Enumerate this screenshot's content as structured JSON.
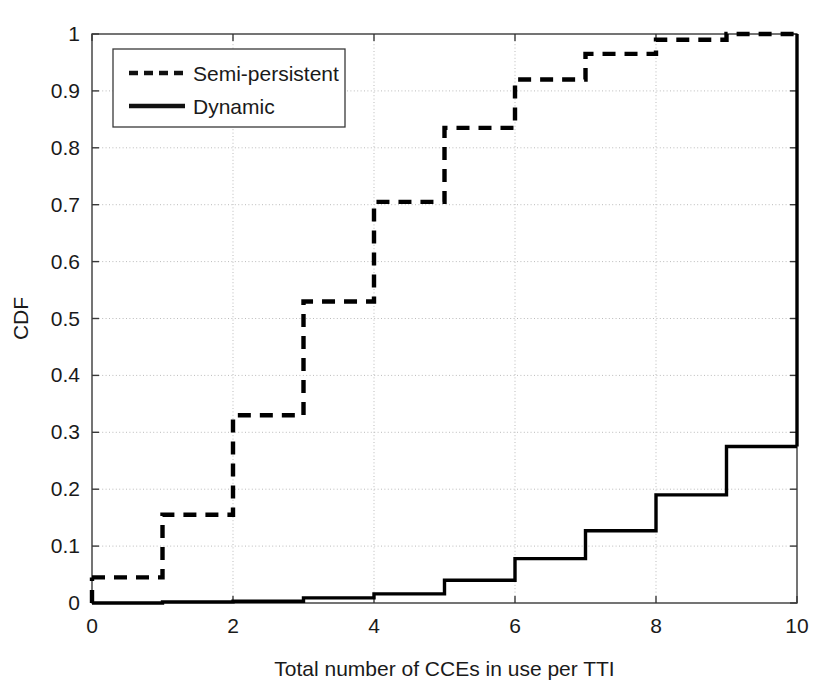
{
  "chart_data": {
    "type": "line",
    "subtype": "step-cdf",
    "title": "",
    "xlabel": "Total number of CCEs in use per TTI",
    "ylabel": "CDF",
    "xlim": [
      0,
      10
    ],
    "ylim": [
      0,
      1
    ],
    "xticks": [
      0,
      2,
      4,
      6,
      8,
      10
    ],
    "xtick_labels": [
      "0",
      "2",
      "4",
      "6",
      "8",
      "10"
    ],
    "yticks": [
      0,
      0.1,
      0.2,
      0.3,
      0.4,
      0.5,
      0.6,
      0.7,
      0.8,
      0.9,
      1
    ],
    "ytick_labels": [
      "0",
      "0.1",
      "0.2",
      "0.3",
      "0.4",
      "0.5",
      "0.6",
      "0.7",
      "0.8",
      "0.9",
      "1"
    ],
    "grid": true,
    "grid_style": "dotted",
    "legend_position": "upper-left",
    "x": [
      0,
      1,
      2,
      3,
      4,
      5,
      6,
      7,
      8,
      9,
      10
    ],
    "series": [
      {
        "name": "Semi-persistent",
        "style": "dashed",
        "color": "#000000",
        "values": [
          0.045,
          0.155,
          0.33,
          0.53,
          0.705,
          0.835,
          0.92,
          0.965,
          0.99,
          1.0,
          1.0
        ]
      },
      {
        "name": "Dynamic",
        "style": "solid",
        "color": "#000000",
        "values": [
          0.0,
          0.002,
          0.003,
          0.009,
          0.016,
          0.04,
          0.078,
          0.127,
          0.19,
          0.275,
          0.275
        ]
      }
    ]
  },
  "legend": {
    "entries": [
      {
        "label": "Semi-persistent",
        "style": "dashed"
      },
      {
        "label": "Dynamic",
        "style": "solid"
      }
    ]
  },
  "colors": {
    "axis": "#3a3a3a",
    "grid": "#bbbbbb",
    "line": "#111111",
    "background": "#ffffff"
  }
}
